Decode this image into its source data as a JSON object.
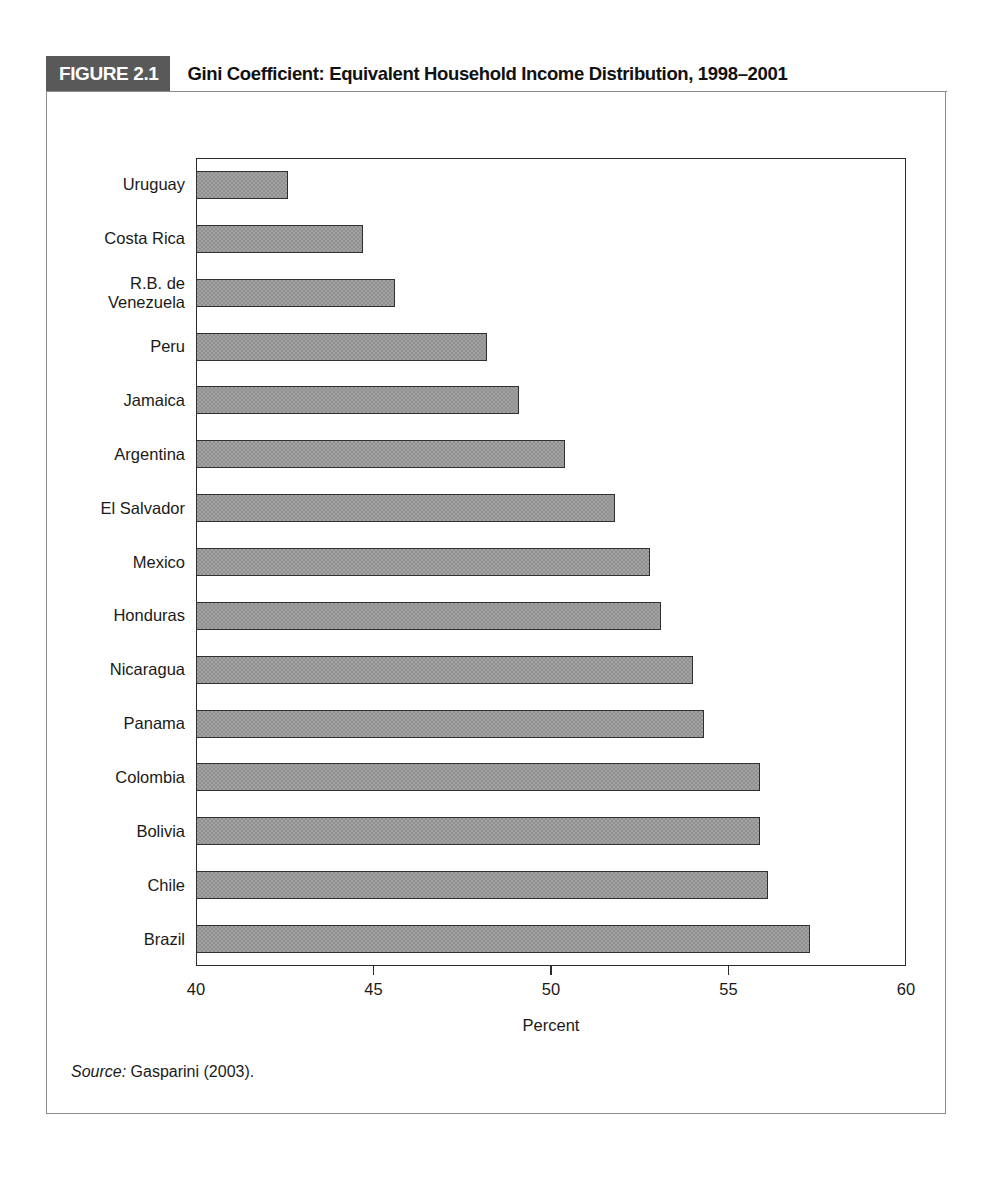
{
  "figure": {
    "tag": "FIGURE 2.1",
    "title": "Gini Coefficient: Equivalent Household Income Distribution, 1998–2001",
    "source_label": "Source:",
    "source_text": " Gasparini (2003)."
  },
  "colors": {
    "tag_background": "#595959",
    "tag_text": "#ffffff",
    "bar_fill": "#909090",
    "bar_border": "#303030",
    "axis": "#2b2b2b",
    "box_border": "#8c8c8c",
    "text": "#1a1a1a"
  },
  "chart_data": {
    "type": "bar",
    "orientation": "horizontal",
    "title": "Gini Coefficient: Equivalent Household Income Distribution, 1998–2001",
    "xlabel": "Percent",
    "ylabel": "",
    "xlim": [
      40,
      60
    ],
    "xticks": [
      40,
      45,
      50,
      55,
      60
    ],
    "xtick_labels": [
      "40",
      "45",
      "50",
      "55",
      "60"
    ],
    "grid": false,
    "legend": null,
    "categories": [
      "Uruguay",
      "Costa Rica",
      "R.B. de\nVenezuela",
      "Peru",
      "Jamaica",
      "Argentina",
      "El Salvador",
      "Mexico",
      "Honduras",
      "Nicaragua",
      "Panama",
      "Colombia",
      "Bolivia",
      "Chile",
      "Brazil"
    ],
    "values": [
      42.6,
      44.7,
      45.6,
      48.2,
      49.1,
      50.4,
      51.8,
      52.8,
      53.1,
      54.0,
      54.3,
      55.9,
      55.9,
      56.1,
      57.3
    ]
  }
}
